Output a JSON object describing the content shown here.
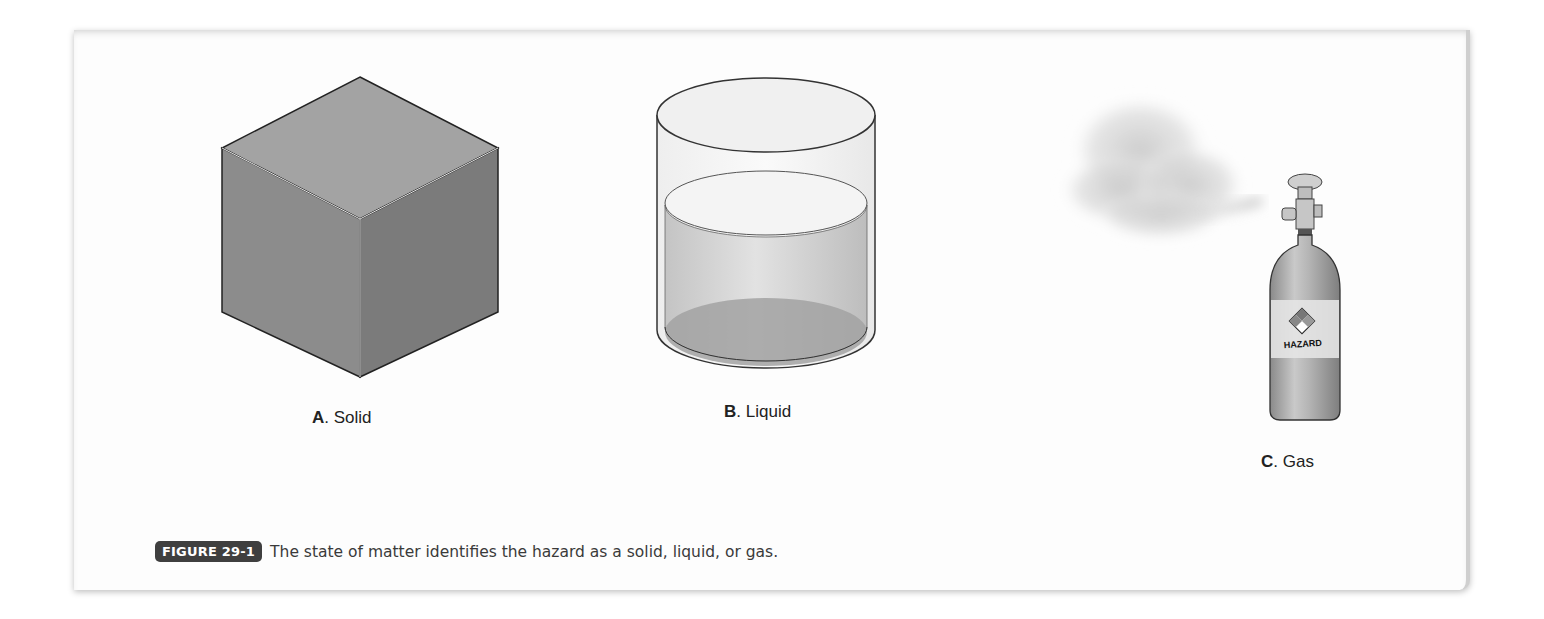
{
  "figure": {
    "number_badge": "FIGURE 29-1",
    "caption": "The state of matter identifies the hazard as a solid, liquid, or gas.",
    "panels": [
      {
        "letter": "A",
        "sep": ". ",
        "name": "Solid",
        "illustration": "cube"
      },
      {
        "letter": "B",
        "sep": ". ",
        "name": "Liquid",
        "illustration": "cylinder-container-with-liquid"
      },
      {
        "letter": "C",
        "sep": ". ",
        "name": "Gas",
        "illustration": "gas-cylinder-releasing-cloud"
      }
    ],
    "cylinder_label": "HAZARD"
  }
}
